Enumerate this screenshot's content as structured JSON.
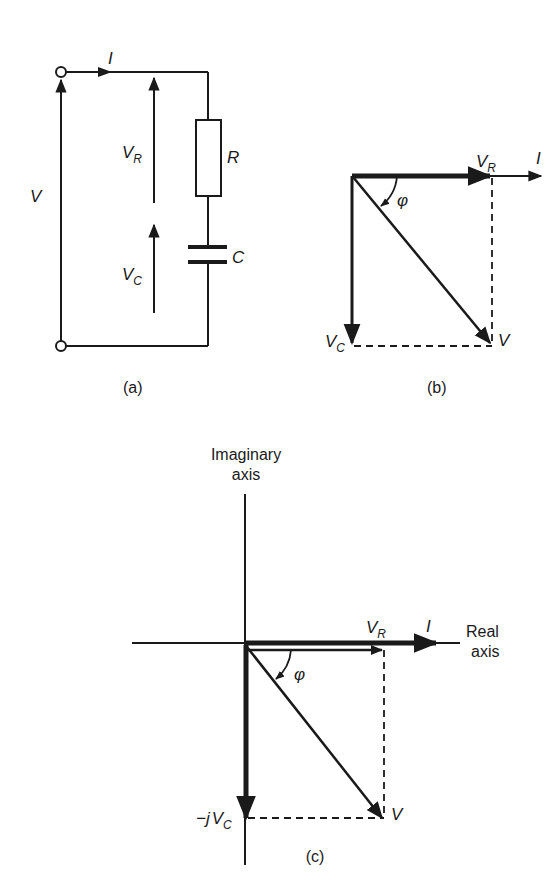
{
  "figure": {
    "panel_a": {
      "caption": "(a)",
      "labels": {
        "current": "I",
        "source_voltage": "V",
        "vr_main": "V",
        "vr_sub": "R",
        "vc_main": "V",
        "vc_sub": "C",
        "resistor": "R",
        "capacitor": "C"
      }
    },
    "panel_b": {
      "caption": "(b)",
      "labels": {
        "vr_main": "V",
        "vr_sub": "R",
        "current": "I",
        "angle": "φ",
        "vc_main": "V",
        "vc_sub": "C",
        "v": "V"
      }
    },
    "panel_c": {
      "caption": "(c)",
      "labels": {
        "imag_axis_line1": "Imaginary",
        "imag_axis_line2": "axis",
        "real_axis_line1": "Real",
        "real_axis_line2": "axis",
        "vr_main": "V",
        "vr_sub": "R",
        "current": "I",
        "angle": "φ",
        "neg_j": "−j",
        "vc_main": "V",
        "vc_sub": "C",
        "v": "V"
      }
    },
    "colors": {
      "ink": "#1a1a1a",
      "background": "#ffffff"
    }
  }
}
